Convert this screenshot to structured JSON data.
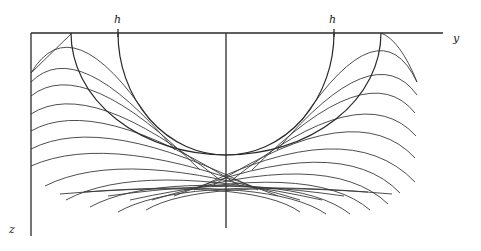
{
  "diagram": {
    "labels": {
      "y_axis": "y",
      "z_axis": "z",
      "h_left": "h",
      "h_right": "h"
    },
    "colors": {
      "line": "#2a2a2a",
      "background": "#ffffff"
    },
    "axes": {
      "horizontal": {
        "x1": 31,
        "y1": 33,
        "x2": 443,
        "y2": 33
      },
      "left_vertical": {
        "x1": 31,
        "y1": 33,
        "x2": 31,
        "y2": 236
      },
      "center_vertical": {
        "x1": 226,
        "y1": 33,
        "x2": 226,
        "y2": 228
      }
    },
    "envelope": {
      "cx": 226,
      "cy": 33,
      "rx": 155,
      "ry": 122
    },
    "inner_arc": {
      "cx": 226,
      "cy": 33,
      "rx": 108,
      "ry": 122
    },
    "left_family": [
      "M31,73 Q72,4 150,120",
      "M31,82 Q78,35 175,150",
      "M31,96 Q84,54 200,170",
      "M31,114 Q90,76 220,180",
      "M31,131 Q96,94 240,186",
      "M31,149 Q104,112 258,190",
      "M31,166 Q112,130 278,196",
      "M45,186 Q124,146 300,200",
      "M66,200 Q140,160 322,200",
      "M90,207 Q158,170 344,196",
      "M118,212 Q178,178 368,192",
      "M146,210 Q200,178 392,194"
    ],
    "right_family": [
      "M417,82 Q380,4 302,120",
      "M417,95 Q374,35 277,150",
      "M415,113 Q368,54 252,170",
      "M416,136 Q362,76 232,180",
      "M415,158 Q356,94 212,186",
      "M415,182 Q348,112 194,190",
      "M400,193 Q340,130 174,196",
      "M388,204 Q328,146 152,200",
      "M370,210 Q312,160 130,200",
      "M350,214 Q294,170 108,196",
      "M326,214 Q274,178 84,192",
      "M300,212 Q252,178 60,194"
    ],
    "cusp_left": "M72,33 L31,73",
    "cusp_right": "M381,33 Q400,40 417,82"
  }
}
